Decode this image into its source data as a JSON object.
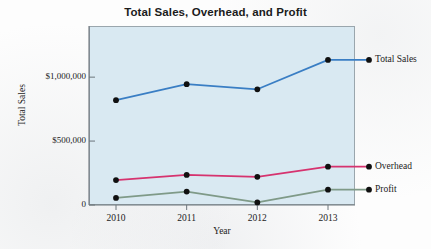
{
  "chart_data": {
    "type": "line",
    "title": "Total Sales, Overhead, and Profit",
    "xlabel": "Year",
    "ylabel": "Total Sales",
    "categories": [
      "2010",
      "2011",
      "2012",
      "2013"
    ],
    "x": [
      2010,
      2011,
      2012,
      2013
    ],
    "ylim": [
      0,
      1400000
    ],
    "yticks": [
      0,
      500000,
      1000000
    ],
    "ytick_labels": [
      "0",
      "$500,000",
      "$1,000,000"
    ],
    "grid": false,
    "legend_position": "right-inline",
    "plot_background": "#d9e9f2",
    "series": [
      {
        "name": "Total Sales",
        "color": "#3a7ec4",
        "marker_color": "#101010",
        "values": [
          820000,
          945000,
          905000,
          1135000
        ]
      },
      {
        "name": "Overhead",
        "color": "#d6336f",
        "marker_color": "#101010",
        "values": [
          195000,
          235000,
          220000,
          300000
        ]
      },
      {
        "name": "Profit",
        "color": "#7f9a88",
        "marker_color": "#101010",
        "values": [
          55000,
          105000,
          20000,
          120000
        ]
      }
    ]
  },
  "legend": {
    "items": [
      {
        "label": "Total Sales"
      },
      {
        "label": "Overhead"
      },
      {
        "label": "Profit"
      }
    ]
  },
  "colors": {
    "total_sales": "#3a7ec4",
    "overhead": "#d6336f",
    "profit": "#7f9a88",
    "plot_bg": "#d9e9f2",
    "axis": "#6d767d",
    "text": "#1b1b1b"
  }
}
